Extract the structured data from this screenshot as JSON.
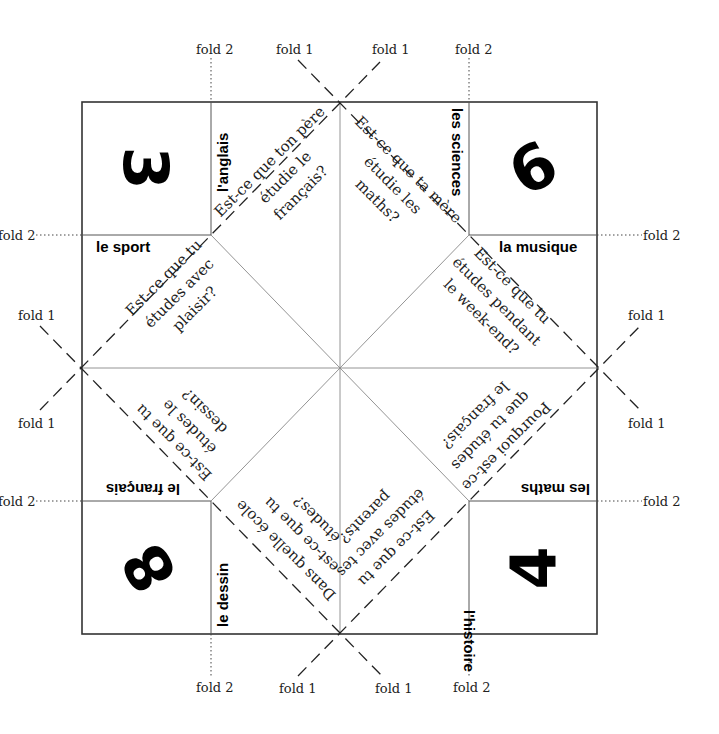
{
  "fold_labels": {
    "fold1": "fold 1",
    "fold2": "fold 2"
  },
  "corners": {
    "top_left": {
      "number": "3",
      "subject_right": "l'anglais",
      "subject_bottom": "le sport"
    },
    "top_right": {
      "number": "6",
      "subject_left": "les sciences",
      "subject_bottom": "la musique"
    },
    "bottom_left": {
      "number": "8",
      "subject_top": "le français",
      "subject_right": "le dessin"
    },
    "bottom_right": {
      "number": "4",
      "subject_top": "les maths",
      "subject_left": "l'histoire"
    }
  },
  "questions": {
    "q1": {
      "lines": [
        "Est-ce que ton père",
        "étudie le",
        "français?"
      ]
    },
    "q2": {
      "lines": [
        "Est-ce que tu",
        "études avec",
        "plaisir?"
      ]
    },
    "q3": {
      "lines": [
        "Est-ce que ta mère",
        "étudie les",
        "maths?"
      ]
    },
    "q4": {
      "lines": [
        "Est-ce que tu",
        "études pendant",
        "le week-end?"
      ]
    },
    "q5": {
      "lines": [
        "Est-ce que tu",
        "études le",
        "dessin?"
      ]
    },
    "q6": {
      "lines": [
        "Dans quelle école",
        "est-ce que tu",
        "études?"
      ]
    },
    "q7": {
      "lines": [
        "Pourquoi est-ce",
        "que tu études",
        "le français?"
      ]
    },
    "q8": {
      "lines": [
        "Est-ce que tu",
        "études avec tes",
        "parents?"
      ]
    }
  }
}
